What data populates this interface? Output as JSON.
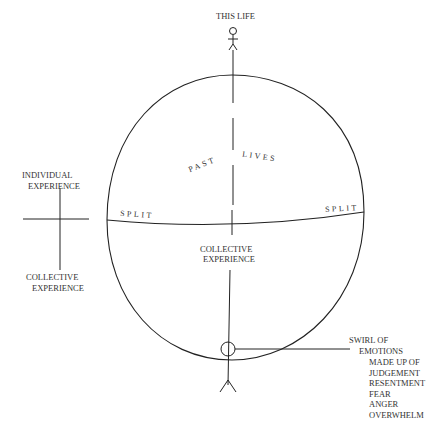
{
  "diagram": {
    "top_figure_label": "THIS LIFE",
    "upper_region": {
      "left_word": "PAST",
      "right_word": "LIVES"
    },
    "split_left": "SPLIT",
    "split_right": "SPLIT",
    "lower_region_label_line1": "COLLECTIVE",
    "lower_region_label_line2": "EXPERIENCE",
    "axis_legend": {
      "top_line1": "INDIVIDUAL",
      "top_line2": "EXPERIENCE",
      "bottom_line1": "COLLECTIVE",
      "bottom_line2": "EXPERIENCE"
    },
    "swirl_callout": {
      "lines": [
        "SWIRL OF",
        "EMOTIONS",
        "MADE UP OF",
        "JUDGEMENT",
        "RESENTMENT",
        "FEAR",
        "ANGER",
        "OVERWHELM"
      ]
    },
    "colors": {
      "stroke": "#222222",
      "background": "#ffffff"
    }
  }
}
